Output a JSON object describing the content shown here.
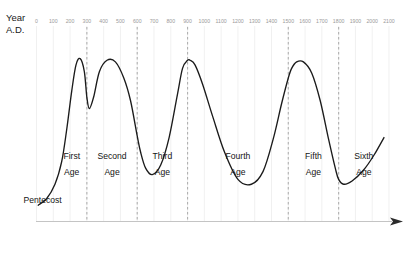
{
  "chart_data": {
    "type": "line",
    "title": "",
    "subtitle": "",
    "xlabel_line1": "Year",
    "xlabel_line2": "A.D.",
    "ylabel": "",
    "grid": true,
    "legend_position": "none",
    "xlim": [
      0,
      2100
    ],
    "ylim": [
      0,
      1
    ],
    "x_tick_step": 100,
    "x_tick_labels": [
      "0",
      "100",
      "200",
      "300",
      "400",
      "500",
      "600",
      "700",
      "800",
      "900",
      "1000",
      "1100",
      "1200",
      "1300",
      "1400",
      "1500",
      "1600",
      "1700",
      "1800",
      "1900",
      "2000",
      "2100"
    ],
    "x_tick_values": [
      0,
      100,
      200,
      300,
      400,
      500,
      600,
      700,
      800,
      900,
      1000,
      1100,
      1200,
      1300,
      1400,
      1500,
      1600,
      1700,
      1800,
      1900,
      2000,
      2100
    ],
    "dividers": [
      {
        "year": 300,
        "label": "first-second-boundary"
      },
      {
        "year": 600,
        "label": "second-third-boundary"
      },
      {
        "year": 900,
        "label": "third-fourth-boundary"
      },
      {
        "year": 1500,
        "label": "fourth-fifth-boundary"
      },
      {
        "year": 1800,
        "label": "fifth-sixth-boundary"
      }
    ],
    "annotations": [
      {
        "name": "pentecost",
        "text": "Pentecost",
        "year": 30
      },
      {
        "name": "first-age",
        "text_line1": "First",
        "text_line2": "Age",
        "year": 210
      },
      {
        "name": "second-age",
        "text_line1": "Second",
        "text_line2": "Age",
        "year": 450
      },
      {
        "name": "third-age",
        "text_line1": "Third",
        "text_line2": "Age",
        "year": 750
      },
      {
        "name": "fourth-age",
        "text_line1": "Fourth",
        "text_line2": "Age",
        "year": 1200
      },
      {
        "name": "fifth-age",
        "text_line1": "Fifth",
        "text_line2": "Age",
        "year": 1650
      },
      {
        "name": "sixth-age",
        "text_line1": "Sixth",
        "text_line2": "Age",
        "year": 1950
      }
    ],
    "series": [
      {
        "name": "church-vitality",
        "color": "#1b1b1b",
        "x": [
          10,
          60,
          110,
          150,
          180,
          210,
          235,
          260,
          285,
          300,
          315,
          340,
          375,
          420,
          470,
          520,
          560,
          600,
          620,
          650,
          690,
          740,
          790,
          840,
          870,
          900,
          915,
          945,
          990,
          1050,
          1120,
          1200,
          1280,
          1350,
          1410,
          1460,
          1500,
          1520,
          1550,
          1590,
          1640,
          1690,
          1740,
          1780,
          1800,
          1830,
          1880,
          1950,
          2010,
          2070
        ],
        "y": [
          0.03,
          0.07,
          0.16,
          0.3,
          0.5,
          0.74,
          0.9,
          0.94,
          0.86,
          0.7,
          0.63,
          0.7,
          0.86,
          0.93,
          0.92,
          0.82,
          0.68,
          0.46,
          0.36,
          0.26,
          0.22,
          0.28,
          0.45,
          0.72,
          0.88,
          0.93,
          0.93,
          0.9,
          0.78,
          0.58,
          0.36,
          0.19,
          0.16,
          0.24,
          0.44,
          0.66,
          0.82,
          0.88,
          0.92,
          0.92,
          0.85,
          0.68,
          0.44,
          0.26,
          0.19,
          0.16,
          0.18,
          0.25,
          0.34,
          0.45
        ]
      }
    ]
  },
  "axis": {
    "arrow_name": "time-arrow",
    "baseline_name": "time-baseline"
  }
}
